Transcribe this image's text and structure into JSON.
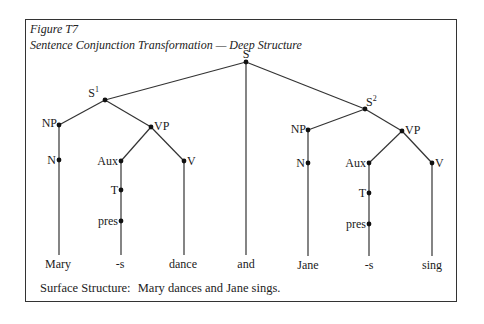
{
  "figure": {
    "label": "Figure T7",
    "title": "Sentence Conjunction Transformation — Deep Structure"
  },
  "tree": {
    "root": {
      "label": "S",
      "x": 246,
      "y": 62
    },
    "left": {
      "s": {
        "label": "S",
        "sup": "1",
        "x": 105,
        "y": 100
      },
      "np": {
        "label": "NP",
        "x": 59,
        "y": 125
      },
      "vp": {
        "label": "VP",
        "x": 151,
        "y": 127
      },
      "n": {
        "label": "N",
        "x": 59,
        "y": 160
      },
      "aux": {
        "label": "Aux",
        "x": 121,
        "y": 161
      },
      "v": {
        "label": "V",
        "x": 184,
        "y": 161
      },
      "t": {
        "label": "T",
        "x": 121,
        "y": 190
      },
      "pres": {
        "label": "pres",
        "x": 121,
        "y": 221
      }
    },
    "right": {
      "s": {
        "label": "S",
        "sup": "2",
        "x": 365,
        "y": 109
      },
      "np": {
        "label": "NP",
        "x": 308,
        "y": 130
      },
      "vp": {
        "label": "VP",
        "x": 402,
        "y": 131
      },
      "n": {
        "label": "N",
        "x": 308,
        "y": 163
      },
      "aux": {
        "label": "Aux",
        "x": 369,
        "y": 163
      },
      "v": {
        "label": "V",
        "x": 432,
        "y": 163
      },
      "t": {
        "label": "T",
        "x": 369,
        "y": 193
      },
      "pres": {
        "label": "pres",
        "x": 369,
        "y": 224
      }
    },
    "leaves": [
      "Mary",
      "-s",
      "dance",
      "and",
      "Jane",
      "-s",
      "sing"
    ]
  },
  "surface": {
    "label": "Surface Structure:",
    "sentence": "Mary dances and Jane sings."
  }
}
